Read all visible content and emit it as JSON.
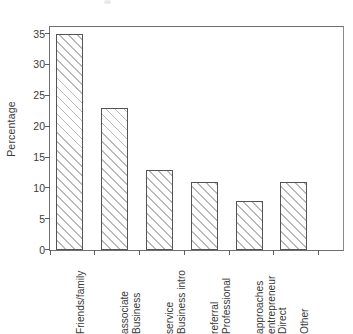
{
  "chart_data": {
    "type": "bar",
    "title": "",
    "subtitle": "",
    "xlabel": "",
    "ylabel": "Percentage",
    "categories": [
      "Friends/family",
      "Business associate",
      "Business intro service",
      "Professional referral",
      "Direct entrepreneur approaches",
      "Other"
    ],
    "category_lines": [
      [
        "Friends/family"
      ],
      [
        "Business",
        "associate"
      ],
      [
        "Business intro",
        "service"
      ],
      [
        "Professional",
        "referral"
      ],
      [
        "Direct",
        "entrepreneur",
        "approaches"
      ],
      [
        "Other"
      ]
    ],
    "values": [
      35,
      23,
      13,
      11,
      8,
      11
    ],
    "ylim": [
      0,
      36
    ],
    "yticks": [
      0,
      5,
      10,
      15,
      20,
      25,
      30,
      35
    ],
    "ytick_labels": [
      "0",
      "5",
      "10",
      "15",
      "20",
      "25",
      "30",
      "35"
    ],
    "grid": false,
    "legend": null,
    "bar_style": {
      "fill": "hatch-diagonal-45",
      "hatch_color": "#b9b9b9",
      "edge_color": "#545454",
      "face_color": "#ffffff"
    },
    "axis_color": "#6f6f6f",
    "text_color": "#3a3a3a"
  }
}
